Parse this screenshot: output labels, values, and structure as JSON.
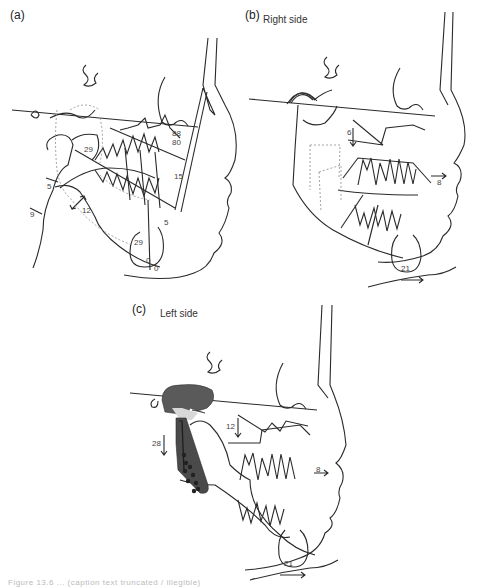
{
  "figure": {
    "panels": [
      {
        "id": "a",
        "label": "(a)",
        "subtitle": "",
        "measurements": [
          "88",
          "80",
          "29",
          "15",
          "5",
          "9",
          "12",
          "5",
          "29",
          "0",
          "0"
        ]
      },
      {
        "id": "b",
        "label": "(b)",
        "subtitle": "Right side",
        "measurements": [
          "6",
          "8",
          "21"
        ]
      },
      {
        "id": "c",
        "label": "(c)",
        "subtitle": "Left side",
        "measurements": [
          "12",
          "28",
          "8",
          "21"
        ]
      }
    ],
    "caption": "Figure 13.6 ... (caption text truncated / illegible)"
  },
  "colors": {
    "line": "#2a2a2a",
    "dotted": "#8a8a8a",
    "plate": "#4a4a4a",
    "text": "#333333"
  }
}
